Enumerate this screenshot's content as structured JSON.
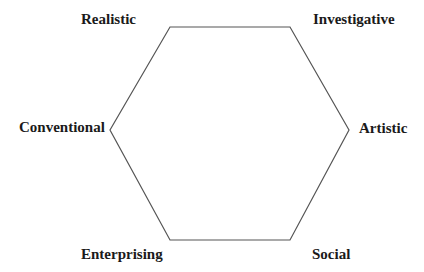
{
  "diagram": {
    "type": "hexagon",
    "line_color": "#555555",
    "vertices": [
      {
        "id": "top-left",
        "x": 170,
        "y": 27
      },
      {
        "id": "top-right",
        "x": 290,
        "y": 27
      },
      {
        "id": "right",
        "x": 349,
        "y": 130
      },
      {
        "id": "bottom-right",
        "x": 290,
        "y": 240
      },
      {
        "id": "bottom-left",
        "x": 170,
        "y": 240
      },
      {
        "id": "left",
        "x": 110,
        "y": 130
      }
    ],
    "labels": {
      "realistic": "Realistic",
      "investigative": "Investigative",
      "artistic": "Artistic",
      "social": "Social",
      "enterprising": "Enterprising",
      "conventional": "Conventional"
    }
  }
}
